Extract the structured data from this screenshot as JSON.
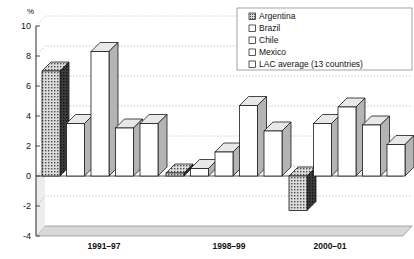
{
  "chart_data": {
    "type": "bar",
    "title": "",
    "xlabel": "",
    "ylabel": "%",
    "ylim": [
      -4,
      10
    ],
    "yticks": [
      10,
      8,
      6,
      4,
      2,
      0,
      -2,
      -4
    ],
    "grid": true,
    "legend_position": "top-right",
    "categories": [
      "1991–97",
      "1998–99",
      "2000–01"
    ],
    "series": [
      {
        "name": "Argentina",
        "pattern": "dotted-shaded",
        "values": [
          7.0,
          0.2,
          -2.3
        ]
      },
      {
        "name": "Brazil",
        "pattern": "white",
        "values": [
          3.5,
          0.5,
          3.5
        ]
      },
      {
        "name": "Chile",
        "pattern": "white",
        "values": [
          8.3,
          1.6,
          4.6
        ]
      },
      {
        "name": "Mexico",
        "pattern": "white",
        "values": [
          3.2,
          4.7,
          3.4
        ]
      },
      {
        "name": "LAC average (13 countries)",
        "pattern": "white",
        "values": [
          3.5,
          3.0,
          2.1
        ]
      }
    ]
  },
  "axis": {
    "unit_label": "%",
    "tick_labels": [
      "10",
      "8",
      "6",
      "4",
      "2",
      "0",
      "-2",
      "-4"
    ],
    "category_labels": [
      "1991–97",
      "1998–99",
      "2000–01"
    ]
  },
  "legend": {
    "items": [
      {
        "label": "Argentina",
        "swatch": "dotted-shaded"
      },
      {
        "label": "Brazil",
        "swatch": "white"
      },
      {
        "label": "Chile",
        "swatch": "white"
      },
      {
        "label": "Mexico",
        "swatch": "white"
      },
      {
        "label": "LAC average (13 countries)",
        "swatch": "white"
      }
    ]
  },
  "colors": {
    "bar_face": "#ffffff",
    "bar_side": "#b4b4b4",
    "bar_top": "#e8e8e8",
    "bar_stroke": "#1a1a1a",
    "pattern_face": "#d0d0d0",
    "pattern_side": "#4a4a4a",
    "floor": "#d8d8d8",
    "grid": "#9a9a9a",
    "axis": "#3a3a3a"
  }
}
